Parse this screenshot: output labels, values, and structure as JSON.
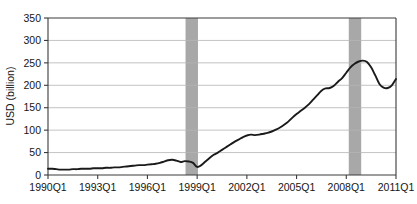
{
  "chart_data": {
    "type": "line",
    "title": "",
    "xlabel": "",
    "ylabel": "USD (billion)",
    "ylim": [
      0,
      350
    ],
    "yticks": [
      0,
      50,
      100,
      150,
      200,
      250,
      300,
      350
    ],
    "ytick_labels": [
      "0",
      "50",
      "100",
      "150",
      "200",
      "250",
      "300",
      "350"
    ],
    "xtick_labels": [
      "1990Q1",
      "1993Q1",
      "1996Q1",
      "1999Q1",
      "2002Q1",
      "2005Q1",
      "2008Q1",
      "2011Q1"
    ],
    "xtick_quarters": [
      0,
      12,
      24,
      36,
      48,
      60,
      72,
      84
    ],
    "xlim_quarters": [
      0,
      84
    ],
    "grid": "horizontal",
    "legend": "none",
    "line_color": "#1a1a1a",
    "shading_color": "#a8a8a8",
    "gridline_color": "#b4b4b4",
    "axis_color": "#3a3a3a",
    "shaded_regions": [
      {
        "name": "recession-band-1998",
        "start_quarter": 33.2,
        "end_quarter": 36.2
      },
      {
        "name": "recession-band-2008",
        "start_quarter": 72.6,
        "end_quarter": 75.6
      }
    ],
    "series": [
      {
        "name": "USD (billion)",
        "x": [
          0,
          1,
          2,
          3,
          4,
          5,
          6,
          7,
          8,
          9,
          10,
          11,
          12,
          13,
          14,
          15,
          16,
          17,
          18,
          19,
          20,
          21,
          22,
          23,
          24,
          25,
          26,
          27,
          28,
          29,
          30,
          31,
          32,
          33,
          34,
          35,
          36,
          37,
          38,
          39,
          40,
          41,
          42,
          43,
          44,
          45,
          46,
          47,
          48,
          49,
          50,
          51,
          52,
          53,
          54,
          55,
          56,
          57,
          58,
          59,
          60,
          61,
          62,
          63,
          64,
          65,
          66,
          67,
          68,
          69,
          70,
          71,
          72,
          73,
          74,
          75,
          76,
          77,
          78,
          79,
          80,
          81,
          82,
          83,
          84
        ],
        "values": [
          14,
          14,
          13,
          12,
          12,
          12,
          13,
          13,
          14,
          14,
          14,
          15,
          15,
          15,
          16,
          16,
          17,
          17,
          18,
          19,
          20,
          21,
          22,
          22,
          23,
          24,
          25,
          27,
          30,
          33,
          34,
          32,
          29,
          31,
          30,
          27,
          18,
          22,
          30,
          38,
          45,
          50,
          56,
          62,
          68,
          74,
          79,
          84,
          88,
          90,
          89,
          90,
          92,
          94,
          97,
          101,
          106,
          112,
          119,
          128,
          136,
          143,
          150,
          158,
          168,
          178,
          188,
          193,
          194,
          199,
          208,
          216,
          228,
          240,
          248,
          253,
          255,
          252,
          240,
          222,
          203,
          195,
          194,
          200,
          214
        ]
      }
    ],
    "annotations": [
      {
        "label": "local peak 1996Q4-1997Q1",
        "quarter": 29,
        "value": 33
      },
      {
        "label": "trough 1998Q4",
        "quarter": 36,
        "value": 18
      },
      {
        "label": "peak 2008Q1",
        "quarter": 74,
        "value": 255
      },
      {
        "label": "trough 2009Q2",
        "quarter": 82,
        "value": 194
      },
      {
        "label": "end 2011Q1",
        "quarter": 84,
        "value": 297
      }
    ]
  },
  "plot_geometry": {
    "left": 48,
    "right": 396,
    "top": 18,
    "bottom": 175
  }
}
